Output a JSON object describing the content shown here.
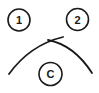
{
  "diagram": {
    "nodes": [
      {
        "id": "node-1",
        "label": "1",
        "cx": 19,
        "cy": 20,
        "r": 11
      },
      {
        "id": "node-2",
        "label": "2",
        "cx": 77.5,
        "cy": 19.5,
        "r": 11
      },
      {
        "id": "node-c",
        "label": "C",
        "cx": 50.5,
        "cy": 74,
        "r": 11.5
      }
    ],
    "arc": {
      "left_curve": "M9,74 Q30,45 63,37",
      "right_curve": "M48,40 Q74,45 92,73"
    },
    "colors": {
      "stroke": "#1a1a1a",
      "background": "#ffffff"
    }
  }
}
